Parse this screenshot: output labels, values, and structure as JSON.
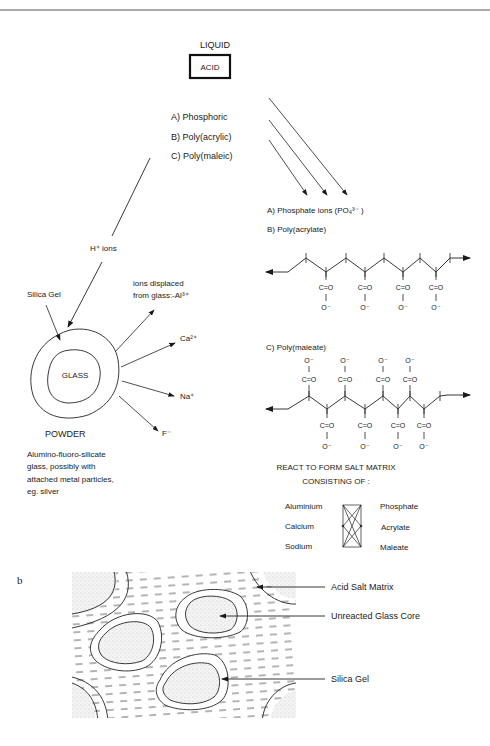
{
  "diagram": {
    "liquid_label": "LIQUID",
    "acid_label": "ACID",
    "acids": [
      "A) Phosphoric",
      "B) Poly(acrylic)",
      "C) Poly(maleic)"
    ],
    "h_ions_label": "H⁺ ions",
    "silica_gel_label": "Silica Gel",
    "glass_label": "GLASS",
    "powder_label": "POWDER",
    "powder_description": [
      "Alumino-fluoro-silicate",
      "glass, possibly with",
      "attached metal particles,",
      "eg. silver"
    ],
    "displaced_ions_label": [
      "ions displaced",
      "from glass:-Al³⁺"
    ],
    "ions": [
      "Ca²⁺",
      "Na⁺",
      "F⁻"
    ],
    "products": {
      "a": "A) Phosphate ions (PO₄³⁻ )",
      "b": "B) Poly(acrylate)",
      "c": "C) Poly(maleate)"
    },
    "carboxyl": "C=O",
    "oxide": "O⁻",
    "salt_matrix_title": [
      "REACT TO FORM SALT MATRIX",
      "CONSISTING OF :"
    ],
    "cations": [
      "Aluminium",
      "Calcium",
      "Sodium"
    ],
    "anions": [
      "Phosphate",
      "Acrylate",
      "Maleate"
    ]
  },
  "panel_b": {
    "label": "b",
    "callouts": [
      "Acid Salt Matrix",
      "Unreacted Glass Core",
      "Silica Gel"
    ]
  }
}
